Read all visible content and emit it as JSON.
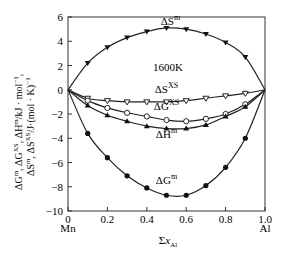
{
  "chart_data": {
    "type": "line",
    "title": "",
    "annotation": "1600K",
    "xlabel": "Σx_Al",
    "ylabel_line1": "ΔG^m, ΔG^XS, ΔH^m/kJ·mol⁻¹,",
    "ylabel_line2": "ΔS^m, ΔS^XS/J·(mol·K)⁻¹",
    "x_end_labels": {
      "left": "Mn",
      "right": "Al"
    },
    "xlim": [
      0,
      1.0
    ],
    "ylim": [
      -10,
      6
    ],
    "xticks": [
      "0",
      "0.2",
      "0.4",
      "0.6",
      "0.8",
      "1.0"
    ],
    "yticks": [
      "6",
      "4",
      "2",
      "0",
      "−2",
      "−4",
      "−6",
      "−8",
      "−10"
    ],
    "grid": false,
    "x": [
      0,
      0.1,
      0.2,
      0.3,
      0.4,
      0.5,
      0.6,
      0.7,
      0.8,
      0.9,
      1.0
    ],
    "series": [
      {
        "name": "ΔS^m",
        "marker": "down-triangle",
        "values": [
          0,
          2.2,
          3.5,
          4.3,
          4.8,
          5.1,
          5.0,
          4.6,
          3.9,
          2.7,
          0
        ]
      },
      {
        "name": "ΔS^XS",
        "marker": "open-down-triangle",
        "values": [
          0,
          -0.7,
          -0.9,
          -1.0,
          -1.0,
          -1.0,
          -0.9,
          -0.7,
          -0.5,
          -0.3,
          0
        ]
      },
      {
        "name": "ΔG^XS",
        "marker": "open-circle",
        "values": [
          0,
          -0.9,
          -1.5,
          -1.9,
          -2.2,
          -2.5,
          -2.6,
          -2.4,
          -2.0,
          -1.2,
          0
        ]
      },
      {
        "name": "ΔH^m",
        "marker": "filled-triangle",
        "values": [
          0,
          -1.3,
          -2.1,
          -2.6,
          -3.0,
          -3.2,
          -3.2,
          -2.9,
          -2.2,
          -1.4,
          0
        ]
      },
      {
        "name": "ΔG^m",
        "marker": "filled-circle",
        "values": [
          0,
          -3.6,
          -5.6,
          -7.1,
          -8.1,
          -8.7,
          -8.7,
          -7.9,
          -6.4,
          -4.0,
          0
        ]
      }
    ],
    "series_labels": [
      {
        "text": "ΔS",
        "sup": "m",
        "x": 0.52,
        "y": 5.3
      },
      {
        "text": "ΔS",
        "sup": "XS",
        "x": 0.5,
        "y": -0.3
      },
      {
        "text": "ΔG",
        "sup": "XS",
        "x": 0.5,
        "y": -1.7
      },
      {
        "text": "ΔH",
        "sup": "m",
        "x": 0.5,
        "y": -4.0
      },
      {
        "text": "ΔG",
        "sup": "m",
        "x": 0.5,
        "y": -7.8
      }
    ]
  }
}
